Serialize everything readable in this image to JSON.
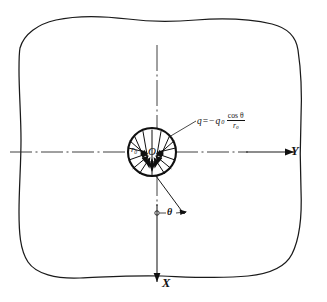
{
  "figure": {
    "type": "engineering-diagram",
    "background_color": "#ffffff",
    "ink_color": "#111111"
  },
  "axes": {
    "horizontal": {
      "label": "Y",
      "direction": "right",
      "arrow": true
    },
    "vertical": {
      "label": "X",
      "direction": "down",
      "arrow": true
    },
    "origin_label": "O"
  },
  "hole": {
    "radius_label": "r",
    "radius_subscript": "0",
    "center_label": "O",
    "arrow_count": 16,
    "arrow_direction": "inward"
  },
  "angle": {
    "label": "θ",
    "measured_from": "X-axis",
    "marker": "arc"
  },
  "equation": {
    "lhs": "q",
    "equals": "=",
    "sign": "−",
    "amplitude": "q",
    "amplitude_subscript": "0",
    "numerator": "cos θ",
    "denominator": "r",
    "denominator_subscript": "0",
    "full_text": "q = -q₀ cos θ / r₀"
  },
  "callouts": {
    "equation_leader": true,
    "theta_leader": true
  }
}
